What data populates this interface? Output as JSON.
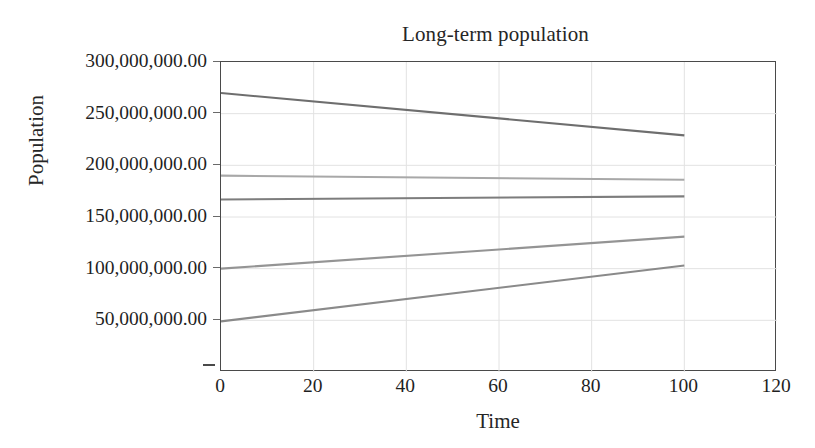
{
  "chart_data": {
    "type": "line",
    "title": "Long-term population",
    "xlabel": "Time",
    "ylabel": "Population",
    "grid": true,
    "legend": "none",
    "xlim": [
      0,
      120
    ],
    "ylim": [
      0,
      300000000
    ],
    "xticks": [
      "0",
      "20",
      "40",
      "60",
      "80",
      "100",
      "120"
    ],
    "xtick_values": [
      0,
      20,
      40,
      60,
      80,
      100,
      120
    ],
    "yticks": [
      "50,000,000.00",
      "100,000,000.00",
      "150,000,000.00",
      "200,000,000.00",
      "250,000,000.00",
      "300,000,000.00"
    ],
    "ytick_values": [
      50000000,
      100000000,
      150000000,
      200000000,
      250000000,
      300000000
    ],
    "x": [
      0,
      100
    ],
    "series": [
      {
        "name": "series-1",
        "color": "#6e6e6e",
        "values": [
          270000000,
          229000000
        ]
      },
      {
        "name": "series-2",
        "color": "#a8a8a8",
        "values": [
          190000000,
          186000000
        ]
      },
      {
        "name": "series-3",
        "color": "#7d7d7d",
        "values": [
          167000000,
          170000000
        ]
      },
      {
        "name": "series-4",
        "color": "#949494",
        "values": [
          100000000,
          131000000
        ]
      },
      {
        "name": "series-5",
        "color": "#8a8a8a",
        "values": [
          49000000,
          103000000
        ]
      }
    ],
    "colors": {
      "axis": "#4a4a4a",
      "grid": "#e2e2e2",
      "text": "#1f1f1f",
      "background": "#ffffff"
    }
  }
}
